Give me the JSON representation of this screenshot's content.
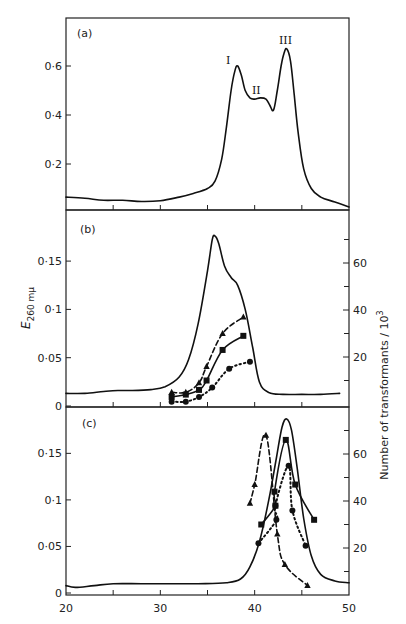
{
  "chart_data": [
    {
      "panel": "(a)",
      "type": "line",
      "xlabel": "",
      "ylabel": "",
      "xlim": [
        20,
        50
      ],
      "ylim": [
        0,
        0.78
      ],
      "yticks": [
        0.2,
        0.4,
        0.6
      ],
      "ytick_labels": [
        "0·2",
        "0·4",
        "0·6"
      ],
      "annotations": [
        {
          "text": "I",
          "x": 38.2,
          "y": 0.63
        },
        {
          "text": "II",
          "x": 40.6,
          "y": 0.5
        },
        {
          "text": "III",
          "x": 43.3,
          "y": 0.7
        }
      ],
      "series": [
        {
          "name": "E260",
          "style": "solid",
          "marker": "none",
          "x": [
            20,
            22,
            24,
            26,
            28,
            30,
            32,
            33.5,
            35,
            35.8,
            36.5,
            37,
            37.5,
            37.9,
            38.2,
            38.6,
            39,
            39.5,
            40,
            40.6,
            41.2,
            41.6,
            42,
            42.4,
            42.8,
            43.1,
            43.4,
            43.8,
            44.2,
            44.6,
            45.2,
            46,
            47,
            48.5,
            50
          ],
          "y": [
            0.065,
            0.06,
            0.052,
            0.052,
            0.047,
            0.05,
            0.065,
            0.08,
            0.1,
            0.13,
            0.22,
            0.35,
            0.5,
            0.58,
            0.6,
            0.56,
            0.5,
            0.47,
            0.465,
            0.47,
            0.465,
            0.44,
            0.42,
            0.5,
            0.6,
            0.65,
            0.67,
            0.62,
            0.48,
            0.33,
            0.18,
            0.1,
            0.065,
            0.045,
            0.025
          ]
        }
      ]
    },
    {
      "panel": "(b)",
      "type": "line",
      "xlabel": "",
      "ylabel": "E260 mμ",
      "ylabel_right": "Number of transformants / 10^3",
      "xlim": [
        20,
        50
      ],
      "ylim": [
        0,
        0.205
      ],
      "yticks": [
        0,
        0.05,
        0.1,
        0.15
      ],
      "ytick_labels": [
        "0",
        "0·05",
        "0·1",
        "0·15"
      ],
      "ylim_right": [
        0,
        82
      ],
      "yticks_right": [
        20,
        40,
        60
      ],
      "yticks_right_minor": [
        10,
        30,
        50,
        70
      ],
      "series": [
        {
          "name": "E260",
          "style": "solid",
          "marker": "none",
          "axis": "left",
          "x": [
            20,
            22,
            24,
            25.5,
            27,
            29,
            30.5,
            32,
            33,
            34,
            35,
            35.5,
            35.8,
            36.2,
            36.8,
            37.5,
            38.2,
            39,
            39.8,
            40.5,
            41.5,
            43,
            45,
            47,
            49
          ],
          "y": [
            0.013,
            0.013,
            0.015,
            0.016,
            0.016,
            0.017,
            0.02,
            0.03,
            0.048,
            0.085,
            0.14,
            0.172,
            0.176,
            0.168,
            0.145,
            0.133,
            0.125,
            0.1,
            0.06,
            0.025,
            0.014,
            0.012,
            0.012,
            0.012,
            0.013
          ]
        },
        {
          "name": "triangles",
          "style": "dashed",
          "marker": "triangle",
          "axis": "right",
          "x": [
            31.2,
            32.7,
            34.1,
            34.9,
            36.6,
            38.8
          ],
          "y": [
            5,
            5,
            9,
            16,
            30,
            37
          ]
        },
        {
          "name": "squares",
          "style": "solid",
          "marker": "square",
          "axis": "right",
          "x": [
            31.2,
            32.7,
            34.1,
            34.9,
            36.6,
            38.8
          ],
          "y": [
            3,
            4,
            6,
            10,
            23,
            29
          ]
        },
        {
          "name": "circles",
          "style": "dotted",
          "marker": "circle",
          "axis": "right",
          "x": [
            31.2,
            32.7,
            34.1,
            35.5,
            37.3,
            39.5
          ],
          "y": [
            1,
            1,
            3,
            7,
            15,
            18
          ]
        }
      ]
    },
    {
      "panel": "(c)",
      "type": "line",
      "xlabel": "",
      "ylabel": "",
      "ylabel_right": "Number of transformants / 10^3",
      "xlim": [
        20,
        50
      ],
      "xticks": [
        20,
        25,
        30,
        35,
        40,
        45,
        50
      ],
      "xtick_labels": [
        "20",
        "",
        "30",
        "",
        "40",
        "",
        "50"
      ],
      "ylim": [
        0,
        0.2
      ],
      "yticks": [
        0,
        0.05,
        0.1,
        0.15
      ],
      "ytick_labels": [
        "0",
        "0·05",
        "0·1",
        "0·15"
      ],
      "ylim_right": [
        0,
        82
      ],
      "yticks_right": [
        20,
        40,
        60
      ],
      "yticks_right_minor": [
        10,
        30,
        50,
        70
      ],
      "series": [
        {
          "name": "E260",
          "style": "solid",
          "marker": "none",
          "axis": "left",
          "x": [
            20,
            21,
            23,
            25,
            28,
            31,
            34,
            37,
            38.5,
            39.5,
            40.5,
            41.5,
            42.3,
            42.9,
            43.4,
            43.9,
            44.5,
            45.2,
            46,
            47,
            48.5,
            50
          ],
          "y": [
            0.008,
            0.006,
            0.008,
            0.01,
            0.01,
            0.01,
            0.01,
            0.011,
            0.015,
            0.028,
            0.055,
            0.1,
            0.145,
            0.178,
            0.187,
            0.175,
            0.135,
            0.08,
            0.04,
            0.02,
            0.013,
            0.011
          ]
        },
        {
          "name": "triangles",
          "style": "dashed",
          "marker": "triangle",
          "axis": "right",
          "x": [
            39.5,
            40,
            41.2,
            42.4,
            43.2,
            45.6
          ],
          "y": [
            39,
            47,
            68,
            26,
            13,
            4
          ]
        },
        {
          "name": "squares",
          "style": "solid",
          "marker": "square",
          "axis": "right",
          "x": [
            40.7,
            42.2,
            42.1,
            43.3,
            44.3,
            46.3
          ],
          "y": [
            30,
            38,
            44,
            66,
            47,
            32
          ]
        },
        {
          "name": "circles",
          "style": "dotted",
          "marker": "circle",
          "axis": "right",
          "x": [
            40.4,
            42.3,
            42.2,
            43.6,
            44,
            45.4
          ],
          "y": [
            22,
            32,
            38,
            55,
            36,
            21
          ]
        }
      ]
    }
  ],
  "labels": {
    "panel_a": "(a)",
    "panel_b": "(b)",
    "panel_c": "(c)",
    "ylabel_left": "E",
    "ylabel_left_sub": "260 mμ",
    "ylabel_right": "Number  of  transformants / 10",
    "ylabel_right_sup": "3",
    "roman_I": "I",
    "roman_II": "II",
    "roman_III": "III"
  }
}
